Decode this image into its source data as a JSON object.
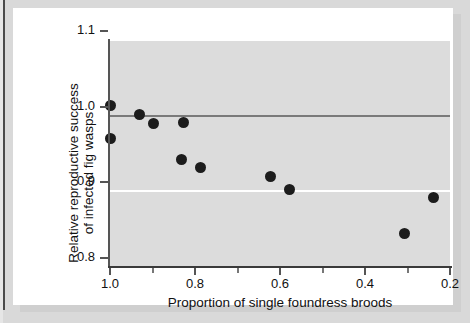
{
  "figure": {
    "background_color": "#d9d9d9",
    "card_color": "#ffffff",
    "plot_background_color": "#dcdcdc"
  },
  "chart_data": {
    "type": "scatter",
    "title": "",
    "xlabel": "Proportion of single foundress broods",
    "ylabel": "Relative reproductive success of infected fig wasps",
    "ylabel_line1": "Relative reproductive success",
    "ylabel_line2": "of infected fig wasps",
    "xlim": [
      1.0,
      0.2
    ],
    "ylim": [
      0.8,
      1.1
    ],
    "x_axis_reversed": true,
    "xticks": [
      1.0,
      0.8,
      0.6,
      0.4,
      0.2
    ],
    "xtick_labels": [
      "1.0",
      "0.8",
      "0.6",
      "0.4",
      "0.2"
    ],
    "x_minor_ticks": [
      0.9,
      0.7,
      0.5,
      0.3
    ],
    "yticks": [
      1.1,
      1.0,
      0.9,
      0.8
    ],
    "ytick_labels": [
      "1.1",
      "1.0",
      "0.9",
      "0.8"
    ],
    "grid": true,
    "gridlines_y": [
      1.1,
      0.9
    ],
    "gridline_color": "#ffffff",
    "reference_line_y": 1.0,
    "reference_line_color": "#7a7a7a",
    "legend": null,
    "marker_color": "#1c1c1c",
    "marker_size": 11,
    "points": [
      {
        "x": 1.0,
        "y": 1.012
      },
      {
        "x": 1.0,
        "y": 0.968
      },
      {
        "x": 0.93,
        "y": 1.0
      },
      {
        "x": 0.898,
        "y": 0.988
      },
      {
        "x": 0.828,
        "y": 0.99
      },
      {
        "x": 0.832,
        "y": 0.941
      },
      {
        "x": 0.787,
        "y": 0.93
      },
      {
        "x": 0.622,
        "y": 0.918
      },
      {
        "x": 0.578,
        "y": 0.901
      },
      {
        "x": 0.308,
        "y": 0.843
      },
      {
        "x": 0.238,
        "y": 0.89
      }
    ]
  }
}
